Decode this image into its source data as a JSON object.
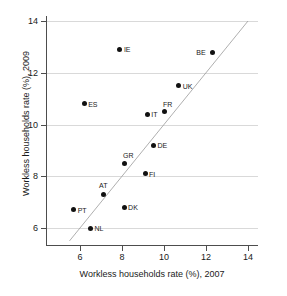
{
  "chart_data": {
    "type": "scatter",
    "title": "",
    "xlabel": "Workless households rate (%), 2007",
    "ylabel": "Workless households rate (%), 2009",
    "xlim": [
      5.2,
      14.0
    ],
    "ylim": [
      5.4,
      14.0
    ],
    "xticks": [
      6,
      8,
      10,
      12,
      14
    ],
    "yticks": [
      6,
      8,
      10,
      12,
      14
    ],
    "xtick_labels": [
      "6",
      "8",
      "10",
      "12",
      "14"
    ],
    "ytick_labels": [
      "6",
      "8",
      "10",
      "12",
      "14"
    ],
    "grid": "horizontal",
    "legend": "none",
    "reference_line": {
      "name": "45-degree-line",
      "type": "identity",
      "from": [
        5.5,
        5.5
      ],
      "to": [
        14.0,
        14.0
      ],
      "style": "thin-solid-grey"
    },
    "points": [
      {
        "label": "IE",
        "x": 7.9,
        "y": 12.9,
        "label_pos": "right"
      },
      {
        "label": "BE",
        "x": 12.3,
        "y": 12.8,
        "label_pos": "left"
      },
      {
        "label": "UK",
        "x": 10.7,
        "y": 11.5,
        "label_pos": "right"
      },
      {
        "label": "ES",
        "x": 6.2,
        "y": 10.8,
        "label_pos": "right"
      },
      {
        "label": "FR",
        "x": 10.0,
        "y": 10.5,
        "label_pos": "above-right"
      },
      {
        "label": "IT",
        "x": 9.2,
        "y": 10.4,
        "label_pos": "right"
      },
      {
        "label": "DE",
        "x": 9.5,
        "y": 9.2,
        "label_pos": "right"
      },
      {
        "label": "GR",
        "x": 8.1,
        "y": 8.5,
        "label_pos": "above-right"
      },
      {
        "label": "FI",
        "x": 9.1,
        "y": 8.1,
        "label_pos": "right"
      },
      {
        "label": "AT",
        "x": 7.1,
        "y": 7.3,
        "label_pos": "above"
      },
      {
        "label": "DK",
        "x": 8.1,
        "y": 6.8,
        "label_pos": "right"
      },
      {
        "label": "PT",
        "x": 5.7,
        "y": 6.7,
        "label_pos": "right"
      },
      {
        "label": "NL",
        "x": 6.5,
        "y": 6.0,
        "label_pos": "right"
      }
    ]
  },
  "axes": {
    "x_ticks": [
      {
        "value": 6,
        "text": "6"
      },
      {
        "value": 8,
        "text": "8"
      },
      {
        "value": 10,
        "text": "10"
      },
      {
        "value": 12,
        "text": "12"
      },
      {
        "value": 14,
        "text": "14"
      }
    ],
    "y_ticks": [
      {
        "value": 6,
        "text": "6"
      },
      {
        "value": 8,
        "text": "8"
      },
      {
        "value": 10,
        "text": "10"
      },
      {
        "value": 12,
        "text": "12"
      },
      {
        "value": 14,
        "text": "14"
      }
    ],
    "x_title": "Workless households rate (%), 2007",
    "y_title": "Workless households rate (%), 2009"
  },
  "colors": {
    "marker": "#111111",
    "grid": "#d9d9d9",
    "axis": "#4d4d4d",
    "refline": "#9a9a9a",
    "text": "#1a1a1a",
    "background": "#ffffff"
  }
}
